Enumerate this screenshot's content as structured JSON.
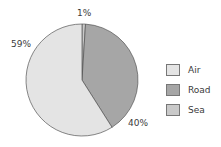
{
  "chart_data": {
    "type": "pie",
    "title": "",
    "categories": [
      "Air",
      "Road",
      "Sea"
    ],
    "values": [
      59,
      40,
      1
    ],
    "units": "%",
    "colors": {
      "Air": "#e4e4e4",
      "Road": "#a6a6a6",
      "Sea": "#c9c9c9"
    },
    "start_angle": "top (12 o'clock), clockwise: Sea, Road, Air",
    "data_labels": [
      "59%",
      "40%",
      "1%"
    ],
    "legend_position": "right"
  },
  "labels": {
    "air": "59%",
    "road": "40%",
    "sea": "1%"
  },
  "legend": [
    {
      "label": "Air",
      "color": "#e4e4e4"
    },
    {
      "label": "Road",
      "color": "#a6a6a6"
    },
    {
      "label": "Sea",
      "color": "#c9c9c9"
    }
  ]
}
